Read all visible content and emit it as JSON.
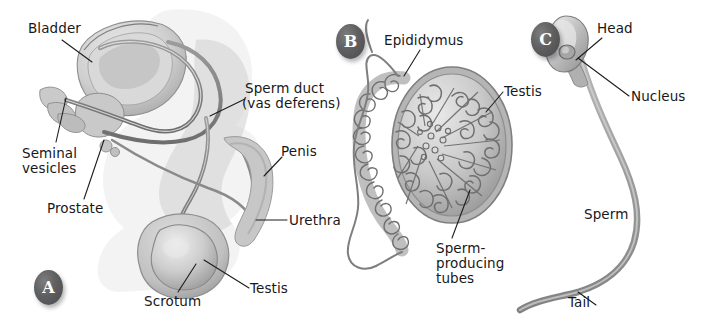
{
  "figure": {
    "background_color": "#ffffff",
    "width": 710,
    "height": 327,
    "ink_color": "#18181a",
    "art_gray_light": "#d8d8d8",
    "art_gray_mid": "#a9a9a9",
    "art_gray_dark": "#6f6f71",
    "leader_line_color": "#1d1d1f"
  },
  "panels": [
    {
      "id": "A",
      "badge_label": "A",
      "name": "male-reproductive-system-side-view",
      "labels": [
        {
          "id": "bladder",
          "text": "Bladder",
          "x": 28,
          "y": 21
        },
        {
          "id": "sperm-duct-l1",
          "text": "Sperm duct",
          "x": 245,
          "y": 81
        },
        {
          "id": "sperm-duct-l2",
          "text": "(vas deferens)",
          "x": 242,
          "y": 96
        },
        {
          "id": "seminal-l1",
          "text": "Seminal",
          "x": 22,
          "y": 146
        },
        {
          "id": "seminal-l2",
          "text": "vesicles",
          "x": 22,
          "y": 161
        },
        {
          "id": "penis",
          "text": "Penis",
          "x": 281,
          "y": 144
        },
        {
          "id": "prostate",
          "text": "Prostate",
          "x": 47,
          "y": 201
        },
        {
          "id": "urethra",
          "text": "Urethra",
          "x": 289,
          "y": 213
        },
        {
          "id": "testis-a",
          "text": "Testis",
          "x": 250,
          "y": 281
        },
        {
          "id": "scrotum",
          "text": "Scrotum",
          "x": 144,
          "y": 294
        }
      ]
    },
    {
      "id": "B",
      "badge_label": "B",
      "name": "testis-and-epididymis-section",
      "labels": [
        {
          "id": "epididymus",
          "text": "Epididymus",
          "x": 384,
          "y": 33
        },
        {
          "id": "testis-b",
          "text": "Testis",
          "x": 504,
          "y": 84
        },
        {
          "id": "sperm-tubes-l1",
          "text": "Sperm-",
          "x": 436,
          "y": 241
        },
        {
          "id": "sperm-tubes-l2",
          "text": "producing",
          "x": 436,
          "y": 256
        },
        {
          "id": "sperm-tubes-l3",
          "text": "tubes",
          "x": 436,
          "y": 271
        }
      ]
    },
    {
      "id": "C",
      "badge_label": "C",
      "name": "sperm-cell",
      "labels": [
        {
          "id": "head",
          "text": "Head",
          "x": 597,
          "y": 21
        },
        {
          "id": "nucleus",
          "text": "Nucleus",
          "x": 631,
          "y": 89
        },
        {
          "id": "sperm",
          "text": "Sperm",
          "x": 584,
          "y": 207
        },
        {
          "id": "tail",
          "text": "Tail",
          "x": 568,
          "y": 295
        }
      ]
    }
  ],
  "badges": [
    {
      "id": "badge-a",
      "label": "A",
      "x": 34,
      "y": 270
    },
    {
      "id": "badge-b",
      "label": "B",
      "x": 336,
      "y": 24
    },
    {
      "id": "badge-c",
      "label": "C",
      "x": 531,
      "y": 22
    }
  ]
}
